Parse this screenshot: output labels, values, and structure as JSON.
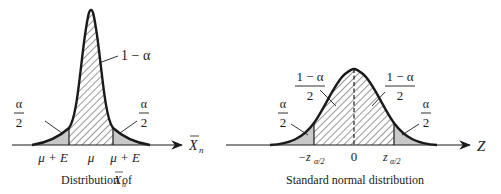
{
  "colors": {
    "ink": "#1a1a1a",
    "tail_fill": "#c8c8c8",
    "hatch": "#1a1a1a",
    "background": "#ffffff"
  },
  "left_panel": {
    "caption_prefix": "Distribution of ",
    "caption_var": "X",
    "caption_sub": "n",
    "axis_var": "X",
    "axis_sub": "n",
    "center_area_label": "1 − α",
    "left_tail": {
      "num": "α",
      "den": "2"
    },
    "right_tail": {
      "num": "α",
      "den": "2"
    },
    "ticks": [
      "μ + E",
      "μ",
      "μ + E"
    ]
  },
  "right_panel": {
    "caption": "Standard normal distribution",
    "axis_var": "Z",
    "left_half": {
      "num": "1 − α",
      "den": "2"
    },
    "right_half": {
      "num": "1 − α",
      "den": "2"
    },
    "left_tail": {
      "num": "α",
      "den": "2"
    },
    "right_tail": {
      "num": "α",
      "den": "2"
    },
    "ticks": {
      "left_main": "−z",
      "left_sub": "α/2",
      "center": "0",
      "right_main": "z",
      "right_sub": "α/2"
    }
  }
}
